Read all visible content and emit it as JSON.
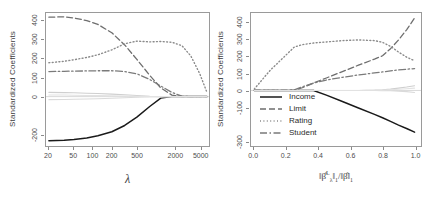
{
  "figure": {
    "panels": [
      {
        "id": "lambda-panel",
        "ylabel": "Standardized Coefficients",
        "xlabel": "λ",
        "y_ticks": [
          "400",
          "300",
          "200",
          "100",
          "0",
          "-200"
        ],
        "x_ticks": [
          "20",
          "50",
          "100",
          "200",
          "500",
          "2000",
          "5000"
        ]
      },
      {
        "id": "norm-ratio-panel",
        "ylabel": "Standardized Coefficients",
        "xlabel_html": "‖β̂<sup>L</sup><sub>λ</sub>‖<sub>1</sub>/‖β̂‖<sub>1</sub>",
        "y_ticks": [
          "400",
          "300",
          "200",
          "100",
          "0",
          "-100",
          "-300"
        ],
        "x_ticks": [
          "0.0",
          "0.2",
          "0.4",
          "0.6",
          "0.8",
          "1.0"
        ]
      }
    ],
    "legend": {
      "position": "bottom-left-of-right-panel",
      "entries": [
        {
          "label": "Income",
          "style": "solid",
          "color": "#1a1a1a"
        },
        {
          "label": "Limit",
          "style": "dashed",
          "color": "#6e6e6e"
        },
        {
          "label": "Rating",
          "style": "dotted",
          "color": "#8a8a8a"
        },
        {
          "label": "Student",
          "style": "dashdot",
          "color": "#7a7a7a"
        }
      ]
    }
  },
  "chart_data": [
    {
      "type": "line",
      "title": "",
      "xlabel": "λ",
      "ylabel": "Standardized Coefficients",
      "xscale": "log",
      "xlim": [
        18,
        7000
      ],
      "ylim": [
        -260,
        440
      ],
      "xticks": [
        20,
        50,
        100,
        200,
        500,
        2000,
        5000
      ],
      "yticks": [
        400,
        300,
        200,
        100,
        0,
        -200
      ],
      "grid": false,
      "legend": "none",
      "x": [
        20,
        35,
        50,
        80,
        120,
        200,
        320,
        500,
        800,
        1200,
        1800,
        2600,
        3600,
        5000,
        6500
      ],
      "series": [
        {
          "name": "Income",
          "style": "solid",
          "color": "#1a1a1a",
          "values": [
            -232,
            -230,
            -226,
            -218,
            -206,
            -185,
            -152,
            -108,
            -52,
            -8,
            0,
            0,
            0,
            0,
            0
          ]
        },
        {
          "name": "Limit",
          "style": "dashed",
          "color": "#6e6e6e",
          "values": [
            418,
            420,
            414,
            400,
            380,
            336,
            272,
            196,
            112,
            46,
            8,
            0,
            0,
            0,
            0
          ]
        },
        {
          "name": "Rating",
          "style": "dotted",
          "color": "#8a8a8a",
          "values": [
            178,
            186,
            194,
            206,
            220,
            246,
            278,
            292,
            288,
            290,
            286,
            268,
            214,
            120,
            22
          ]
        },
        {
          "name": "Student",
          "style": "dashdot",
          "color": "#7a7a7a",
          "values": [
            132,
            133,
            134,
            135,
            136,
            136,
            132,
            120,
            90,
            56,
            22,
            2,
            0,
            0,
            0
          ]
        },
        {
          "name": "other-1",
          "style": "solid",
          "color": "#cfcfcf",
          "values": [
            22,
            21,
            20,
            18,
            16,
            13,
            10,
            6,
            2,
            0,
            0,
            0,
            0,
            0,
            0
          ]
        },
        {
          "name": "other-2",
          "style": "solid",
          "color": "#dadada",
          "values": [
            -16,
            -15,
            -14,
            -13,
            -11,
            -9,
            -6,
            -3,
            -1,
            0,
            0,
            0,
            0,
            0,
            0
          ]
        },
        {
          "name": "other-3",
          "style": "solid",
          "color": "#e2e2e2",
          "values": [
            8,
            8,
            7,
            6,
            5,
            4,
            3,
            1,
            0,
            0,
            0,
            0,
            0,
            0,
            0
          ]
        }
      ]
    },
    {
      "type": "line",
      "title": "",
      "xlabel": "‖beta-hat-L-lambda‖_1 / ‖beta-hat‖_1",
      "ylabel": "Standardized Coefficients",
      "xscale": "linear",
      "xlim": [
        -0.02,
        1.04
      ],
      "ylim": [
        -330,
        460
      ],
      "xticks": [
        0.0,
        0.2,
        0.4,
        0.6,
        0.8,
        1.0
      ],
      "yticks": [
        400,
        300,
        200,
        100,
        0,
        -100,
        -300
      ],
      "grid": false,
      "legend": "lower-left",
      "x": [
        0.0,
        0.1,
        0.2,
        0.25,
        0.3,
        0.37,
        0.45,
        0.55,
        0.65,
        0.75,
        0.8,
        0.85,
        0.9,
        0.95,
        1.0
      ],
      "series": [
        {
          "name": "Income",
          "style": "solid",
          "color": "#1a1a1a",
          "values": [
            0,
            0,
            0,
            0,
            0,
            0,
            -28,
            -66,
            -104,
            -142,
            -162,
            -184,
            -206,
            -226,
            -248
          ]
        },
        {
          "name": "Limit",
          "style": "dashed",
          "color": "#6e6e6e",
          "values": [
            0,
            0,
            0,
            2,
            16,
            44,
            74,
            112,
            150,
            186,
            206,
            248,
            300,
            360,
            430
          ]
        },
        {
          "name": "Rating",
          "style": "dotted",
          "color": "#8a8a8a",
          "values": [
            8,
            120,
            212,
            258,
            272,
            282,
            288,
            296,
            300,
            296,
            286,
            262,
            228,
            198,
            176
          ]
        },
        {
          "name": "Student",
          "style": "dashdot",
          "color": "#7a7a7a",
          "values": [
            0,
            0,
            0,
            4,
            22,
            44,
            62,
            78,
            92,
            104,
            110,
            116,
            122,
            126,
            130
          ]
        },
        {
          "name": "other-1",
          "style": "solid",
          "color": "#cfcfcf",
          "values": [
            0,
            0,
            0,
            0,
            0,
            0,
            0,
            0,
            0,
            2,
            4,
            8,
            14,
            20,
            28
          ]
        },
        {
          "name": "other-2",
          "style": "solid",
          "color": "#dadada",
          "values": [
            0,
            0,
            0,
            0,
            0,
            0,
            0,
            0,
            0,
            0,
            -1,
            -2,
            -4,
            -7,
            -12
          ]
        },
        {
          "name": "other-3",
          "style": "solid",
          "color": "#e2e2e2",
          "values": [
            0,
            0,
            0,
            0,
            0,
            0,
            0,
            0,
            0,
            1,
            2,
            4,
            7,
            10,
            14
          ]
        }
      ]
    }
  ]
}
